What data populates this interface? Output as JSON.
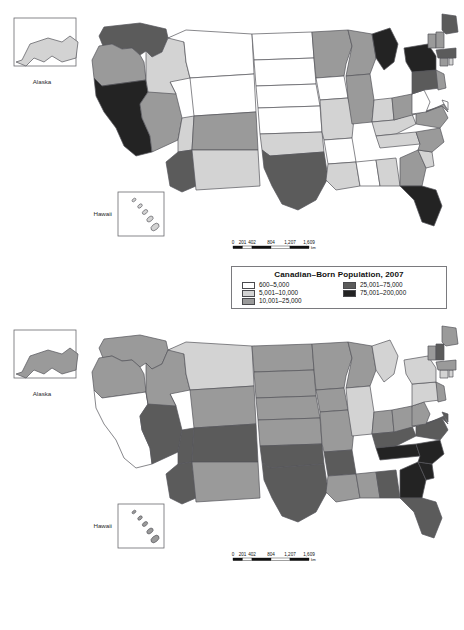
{
  "maps": [
    {
      "id": "canadian-born-population-2007",
      "insets": [
        {
          "name": "alaska",
          "label": "Alaska"
        },
        {
          "name": "hawaii",
          "label": "Hawaii"
        }
      ],
      "scale_bar": {
        "ticks": [
          "0",
          "201",
          "402",
          "804",
          "1,207",
          "1,609"
        ],
        "unit": "km"
      },
      "legend": {
        "title": "Canadian–Born Population, 2007",
        "columns": [
          [
            {
              "label": "600–5,000",
              "color": "#ffffff"
            },
            {
              "label": "5,001–10,000",
              "color": "#d3d3d3"
            },
            {
              "label": "10,001–25,000",
              "color": "#9a9a9a"
            }
          ],
          [
            {
              "label": "25,001–75,000",
              "color": "#5b5b5b"
            },
            {
              "label": "75,001–200,000",
              "color": "#232323"
            }
          ]
        ]
      },
      "chart_data": {
        "type": "heatmap",
        "title": "Canadian–Born Population, 2007",
        "classes": [
          "600–5,000",
          "5,001–10,000",
          "10,001–25,000",
          "25,001–75,000",
          "75,001–200,000"
        ],
        "class_colors": [
          "#ffffff",
          "#d3d3d3",
          "#9a9a9a",
          "#5b5b5b",
          "#232323"
        ],
        "values": {
          "AK": 2,
          "HI": 2,
          "WA": 4,
          "OR": 3,
          "CA": 5,
          "NV": 3,
          "ID": 2,
          "MT": 1,
          "WY": 1,
          "UT": 2,
          "AZ": 4,
          "CO": 3,
          "NM": 2,
          "ND": 1,
          "SD": 1,
          "NE": 1,
          "KS": 1,
          "OK": 2,
          "TX": 4,
          "MN": 3,
          "IA": 1,
          "MO": 2,
          "AR": 1,
          "LA": 2,
          "WI": 3,
          "IL": 3,
          "MS": 1,
          "AL": 2,
          "MI": 5,
          "IN": 2,
          "KY": 2,
          "TN": 2,
          "OH": 3,
          "GA": 3,
          "FL": 5,
          "SC": 2,
          "NC": 3,
          "VA": 3,
          "WV": 1,
          "PA": 4,
          "NY": 5,
          "MD": 3,
          "DE": 1,
          "NJ": 3,
          "CT": 3,
          "RI": 2,
          "MA": 4,
          "VT": 3,
          "NH": 3,
          "ME": 4
        }
      }
    },
    {
      "id": "change-in-canadian-born-population-1970-2007",
      "insets": [
        {
          "name": "alaska",
          "label": "Alaska"
        },
        {
          "name": "hawaii",
          "label": "Hawaii"
        }
      ],
      "scale_bar": {
        "ticks": [
          "0",
          "201",
          "402",
          "804",
          "1,207",
          "1,609"
        ],
        "unit": "km"
      },
      "legend": {
        "title": "Change in Canadian–Born Population, 1970–2007",
        "columns": [
          [
            {
              "label": "−71%–−10%",
              "color": "#ffffff"
            },
            {
              "label": "−9%–0%",
              "color": "#d3d3d3"
            },
            {
              "label": "1%–100%",
              "color": "#9a9a9a"
            }
          ],
          [
            {
              "label": "101%–250%",
              "color": "#5b5b5b"
            },
            {
              "label": "251%–600%",
              "color": "#232323"
            }
          ]
        ]
      },
      "chart_data": {
        "type": "heatmap",
        "title": "Change in Canadian–Born Population, 1970–2007",
        "classes": [
          "−71%–−10%",
          "−9%–0%",
          "1%–100%",
          "101%–250%",
          "251%–600%"
        ],
        "class_colors": [
          "#ffffff",
          "#d3d3d3",
          "#9a9a9a",
          "#5b5b5b",
          "#232323"
        ],
        "values": {
          "AK": 3,
          "HI": 3,
          "WA": 3,
          "OR": 3,
          "CA": 1,
          "NV": 4,
          "ID": 3,
          "MT": 2,
          "WY": 3,
          "UT": 4,
          "AZ": 4,
          "CO": 4,
          "NM": 3,
          "ND": 3,
          "SD": 3,
          "NE": 3,
          "KS": 3,
          "OK": 4,
          "TX": 4,
          "MN": 3,
          "IA": 3,
          "MO": 3,
          "AR": 4,
          "LA": 3,
          "WI": 3,
          "IL": 2,
          "MS": 3,
          "AL": 4,
          "MI": 2,
          "IN": 3,
          "KY": 4,
          "TN": 5,
          "OH": 3,
          "GA": 5,
          "FL": 4,
          "SC": 5,
          "NC": 5,
          "VA": 4,
          "WV": 3,
          "PA": 2,
          "NY": 2,
          "MD": 4,
          "DE": 4,
          "NJ": 3,
          "CT": 2,
          "RI": 2,
          "MA": 3,
          "VT": 3,
          "NH": 4,
          "ME": 3
        }
      }
    }
  ]
}
